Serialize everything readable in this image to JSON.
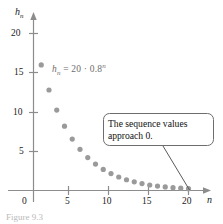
{
  "figure": {
    "formula_lhs": "h",
    "formula_lhs_sub": "n",
    "formula_rhs": " = 20 · 0.8",
    "formula_exp": "n",
    "formula_full": "h_n = 20 · 0.8^n",
    "callout_text": "The sequence values approach 0.",
    "caption": "Figure 9.3",
    "point_color": "#9a9a9a",
    "axis_color": "#8c8c8c",
    "callout_border_color": "#6d6d6d",
    "formula_color": "#6e6e6e"
  },
  "chart_data": {
    "type": "scatter",
    "title": "",
    "xlabel": "n",
    "ylabel": "h_n",
    "annotation_formula": "h_n = 20 · 0.8^n",
    "annotation_note": "The sequence values approach 0.",
    "grid": false,
    "legend": "none",
    "xlim": [
      0,
      21.5
    ],
    "ylim": [
      0,
      21.5
    ],
    "xticks": [
      0,
      5,
      10,
      15,
      20
    ],
    "xtick_labels": [
      "0",
      "5",
      "10",
      "15",
      "20"
    ],
    "yticks": [
      5,
      10,
      15,
      20
    ],
    "ytick_labels": [
      "5",
      "10",
      "15",
      "20"
    ],
    "x": [
      1,
      2,
      3,
      4,
      5,
      6,
      7,
      8,
      9,
      10,
      11,
      12,
      13,
      14,
      15,
      16,
      17,
      18,
      19,
      20
    ],
    "y": [
      16.0,
      12.8,
      10.24,
      8.19,
      6.55,
      5.24,
      4.19,
      3.36,
      2.68,
      2.15,
      1.72,
      1.37,
      1.1,
      0.88,
      0.7,
      0.56,
      0.45,
      0.36,
      0.29,
      0.23
    ]
  }
}
